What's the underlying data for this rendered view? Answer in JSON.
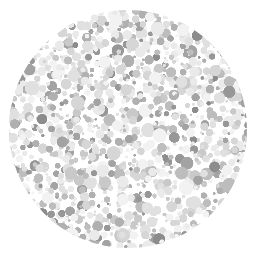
{
  "image": {
    "kind": "ishihara-plate-grayscale",
    "title": "Ishihara color vision test plate (grayscale)",
    "width": 257,
    "height": 258,
    "background_color": "#ffffff"
  },
  "plate": {
    "name": "dot-mosaic-disc",
    "center_x": 128,
    "center_y": 129,
    "radius": 119,
    "clip_shape": "circle",
    "hidden_figure_visible": false,
    "hidden_figure_label": "none discernible in grayscale"
  },
  "dots": {
    "count": 1150,
    "min_diameter": 3,
    "max_diameter": 15,
    "edge_softness_px": 0.6,
    "packing": "poisson-like random with overlap",
    "size_weights": [
      {
        "diameter": 4,
        "weight": 26
      },
      {
        "diameter": 6,
        "weight": 24
      },
      {
        "diameter": 8,
        "weight": 20
      },
      {
        "diameter": 10,
        "weight": 15
      },
      {
        "diameter": 12,
        "weight": 10
      },
      {
        "diameter": 14,
        "weight": 5
      }
    ],
    "palette": [
      {
        "name": "near-white",
        "hex": "#f2f2f2",
        "weight": 14
      },
      {
        "name": "very-light-gray",
        "hex": "#eaeaea",
        "weight": 16
      },
      {
        "name": "light-gray",
        "hex": "#e0e0e0",
        "weight": 15
      },
      {
        "name": "pale-gray",
        "hex": "#d6d6d6",
        "weight": 13
      },
      {
        "name": "soft-gray",
        "hex": "#c9c9c9",
        "weight": 11
      },
      {
        "name": "mid-light-gray",
        "hex": "#bdbdbd",
        "weight": 9
      },
      {
        "name": "mid-gray",
        "hex": "#b0b0b0",
        "weight": 8
      },
      {
        "name": "medium-gray",
        "hex": "#a3a3a3",
        "weight": 7
      },
      {
        "name": "dark-medium-gray",
        "hex": "#979797",
        "weight": 5
      },
      {
        "name": "darkest-gray",
        "hex": "#8c8c8c",
        "weight": 2
      }
    ],
    "random_seed": 20240517
  }
}
